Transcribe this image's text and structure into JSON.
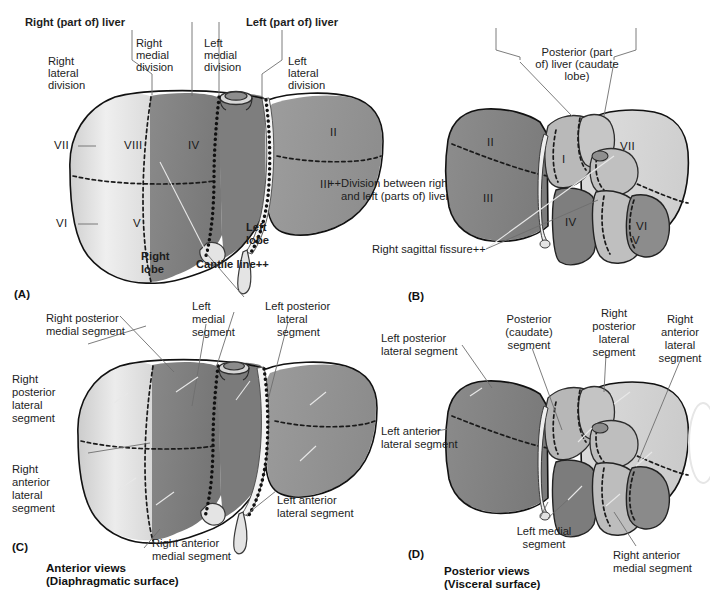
{
  "figure": {
    "footnote_marker": "++",
    "footnote": "++Division between right\nand left (parts of) liver",
    "footnote_line1": "++Division between right",
    "footnote_line2": "and left (parts of) liver",
    "right_sagittal_fissure": "Right sagittal fissure++"
  },
  "colors": {
    "page_background": "#ffffff",
    "ink": "#1a1a1a",
    "leader_line": "#6e6e6e",
    "outline": "#111111",
    "tone_dark": "#7b7b7b",
    "tone_mid": "#9a9a9a",
    "tone_light": "#c9c9c9",
    "tone_pale": "#e2e2e2",
    "tone_white": "#efefef"
  },
  "panels": [
    {
      "id": "A",
      "tag": "(A)",
      "view": "Anterior view (Diaphragmatic surface)",
      "labels_top": [
        {
          "key": "right_part_liver",
          "text": "Right (part of) liver",
          "bold": true
        },
        {
          "key": "left_part_liver",
          "text": "Left (part of) liver",
          "bold": true
        },
        {
          "key": "right_medial_division",
          "text": "Right\nmedial\ndivision",
          "bold": false
        },
        {
          "key": "left_medial_division",
          "text": "Left\nmedial\ndivision",
          "bold": false
        },
        {
          "key": "right_lateral_division",
          "text": "Right\nlateral\ndivision",
          "bold": false
        },
        {
          "key": "left_lateral_division",
          "text": "Left\nlateral\ndivision",
          "bold": false
        }
      ],
      "right_medial_division_l1": "Right",
      "right_medial_division_l2": "medial",
      "right_medial_division_l3": "division",
      "left_medial_division_l1": "Left",
      "left_medial_division_l2": "medial",
      "left_medial_division_l3": "division",
      "right_lateral_division_l1": "Right",
      "right_lateral_division_l2": "lateral",
      "right_lateral_division_l3": "division",
      "left_lateral_division_l1": "Left",
      "left_lateral_division_l2": "lateral",
      "left_lateral_division_l3": "division",
      "right_part_liver": "Right (part of) liver",
      "left_part_liver": "Left (part of) liver",
      "right_lobe_l1": "Right",
      "right_lobe_l2": "lobe",
      "left_lobe_l1": "Left",
      "left_lobe_l2": "lobe",
      "cantlie_line": "Cantlie line++",
      "segments": [
        {
          "roman": "II"
        },
        {
          "roman": "III"
        },
        {
          "roman": "IV"
        },
        {
          "roman": "V"
        },
        {
          "roman": "VI"
        },
        {
          "roman": "VII"
        },
        {
          "roman": "VIII"
        }
      ]
    },
    {
      "id": "B",
      "tag": "(B)",
      "view": "Posterior view (Visceral surface)",
      "posterior_caudate_l1": "Posterior (part",
      "posterior_caudate_l2": "of) liver (caudate",
      "posterior_caudate_l3": "lobe)",
      "right_sagittal_fissure": "Right sagittal fissure++",
      "segments": [
        {
          "roman": "I"
        },
        {
          "roman": "II"
        },
        {
          "roman": "III"
        },
        {
          "roman": "IV"
        },
        {
          "roman": "V"
        },
        {
          "roman": "VI"
        },
        {
          "roman": "VII"
        }
      ]
    },
    {
      "id": "C",
      "tag": "(C)",
      "view": "Anterior views (Diaphragmatic surface)",
      "caption_l1": "Anterior views",
      "caption_l2": "(Diaphragmatic surface)",
      "labels": [
        {
          "key": "right_posterior_medial_segment",
          "l1": "Right posterior",
          "l2": "medial segment"
        },
        {
          "key": "right_posterior_lateral_segment",
          "l1": "Right",
          "l2": "posterior",
          "l3": "lateral",
          "l4": "segment"
        },
        {
          "key": "right_anterior_lateral_segment",
          "l1": "Right",
          "l2": "anterior",
          "l3": "lateral",
          "l4": "segment"
        },
        {
          "key": "right_anterior_medial_segment",
          "l1": "Right anterior",
          "l2": "medial segment"
        },
        {
          "key": "left_medial_segment",
          "l1": "Left",
          "l2": "medial",
          "l3": "segment"
        },
        {
          "key": "left_posterior_lateral_segment",
          "l1": "Left posterior",
          "l2": "lateral",
          "l3": "segment"
        },
        {
          "key": "left_anterior_lateral_segment",
          "l1": "Left anterior",
          "l2": "lateral segment"
        }
      ]
    },
    {
      "id": "D",
      "tag": "(D)",
      "view": "Posterior views (Visceral surface)",
      "caption_l1": "Posterior views",
      "caption_l2": "(Visceral surface)",
      "labels": [
        {
          "key": "left_posterior_lateral_segment",
          "l1": "Left posterior",
          "l2": "lateral segment"
        },
        {
          "key": "posterior_caudate_segment",
          "l1": "Posterior",
          "l2": "(caudate)",
          "l3": "segment"
        },
        {
          "key": "right_posterior_lateral_segment",
          "l1": "Right",
          "l2": "posterior",
          "l3": "lateral",
          "l4": "segment"
        },
        {
          "key": "right_anterior_lateral_segment",
          "l1": "Right",
          "l2": "anterior",
          "l3": "lateral",
          "l4": "segment"
        },
        {
          "key": "left_anterior_lateral_segment",
          "l1": "Left anterior",
          "l2": "lateral segment"
        },
        {
          "key": "left_medial_segment",
          "l1": "Left medial",
          "l2": "segment"
        },
        {
          "key": "right_anterior_medial_segment",
          "l1": "Right anterior",
          "l2": "medial segment"
        }
      ]
    }
  ],
  "panelC_labels": {
    "rpms_l1": "Right posterior",
    "rpms_l2": "medial segment",
    "rpls_l1": "Right",
    "rpls_l2": "posterior",
    "rpls_l3": "lateral",
    "rpls_l4": "segment",
    "rals_l1": "Right",
    "rals_l2": "anterior",
    "rals_l3": "lateral",
    "rals_l4": "segment",
    "rams_l1": "Right anterior",
    "rams_l2": "medial segment",
    "lms_l1": "Left",
    "lms_l2": "medial",
    "lms_l3": "segment",
    "lpls_l1": "Left posterior",
    "lpls_l2": "lateral",
    "lpls_l3": "segment",
    "lals_l1": "Left anterior",
    "lals_l2": "lateral segment"
  },
  "panelD_labels": {
    "lpls_l1": "Left posterior",
    "lpls_l2": "lateral segment",
    "pcs_l1": "Posterior",
    "pcs_l2": "(caudate)",
    "pcs_l3": "segment",
    "rpls_l1": "Right",
    "rpls_l2": "posterior",
    "rpls_l3": "lateral",
    "rpls_l4": "segment",
    "rals_l1": "Right",
    "rals_l2": "anterior",
    "rals_l3": "lateral",
    "rals_l4": "segment",
    "lals_l1": "Left anterior",
    "lals_l2": "lateral segment",
    "lms_l1": "Left medial",
    "lms_l2": "segment",
    "rams_l1": "Right anterior",
    "rams_l2": "medial segment"
  }
}
